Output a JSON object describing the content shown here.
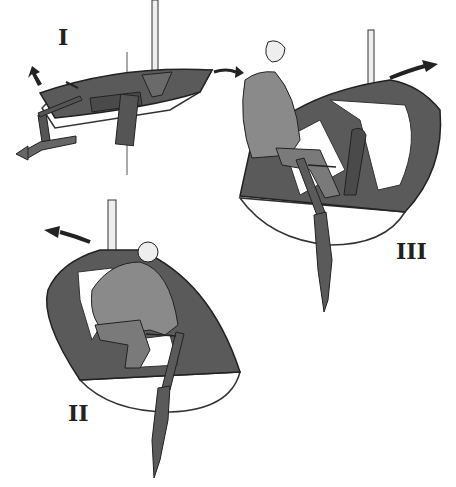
{
  "figure": {
    "panels": [
      {
        "id": "I",
        "label": "I",
        "content": "boat viewed from above, tiller and rudder, arrows indicating motion"
      },
      {
        "id": "II",
        "label": "II",
        "content": "sailor crouched in boat seen from stern, moving across, arrow pointing left"
      },
      {
        "id": "III",
        "label": "III",
        "content": "sailor seated on side deck holding tiller, arrow pointing right"
      }
    ],
    "colors": {
      "hull_dark": "#5a5a5a",
      "hull_light": "#ffffff",
      "figure": "#8a8a8a",
      "outline": "#222222"
    }
  }
}
